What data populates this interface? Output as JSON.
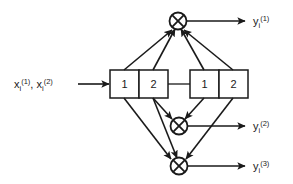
{
  "figure": {
    "type": "block-diagram",
    "background_color": "#ffffff",
    "line_color": "#1a1a1a",
    "box_fill": "#ffffff"
  },
  "input": {
    "label_base_1": "x",
    "label_sub_1": "i",
    "label_sup_1": "(1)",
    "separator": ", ",
    "label_base_2": "x",
    "label_sub_2": "i",
    "label_sup_2": "(2)"
  },
  "registers": [
    {
      "name": "shift-register-left",
      "cells": [
        {
          "label": "1"
        },
        {
          "label": "2"
        }
      ]
    },
    {
      "name": "shift-register-right",
      "cells": [
        {
          "label": "1"
        },
        {
          "label": "2"
        }
      ]
    }
  ],
  "adders": [
    {
      "name": "modulo2-adder-top",
      "symbol": "xor"
    },
    {
      "name": "modulo2-adder-middle",
      "symbol": "xor"
    },
    {
      "name": "modulo2-adder-bottom",
      "symbol": "xor"
    }
  ],
  "outputs": [
    {
      "base": "y",
      "sub": "i",
      "sup": "(1)"
    },
    {
      "base": "y",
      "sub": "i",
      "sup": "(2)"
    },
    {
      "base": "y",
      "sub": "i",
      "sup": "(3)"
    }
  ]
}
